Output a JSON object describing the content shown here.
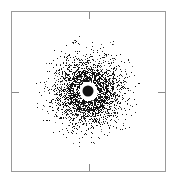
{
  "chart_data": {
    "type": "scatter",
    "title": "",
    "xlabel": "",
    "ylabel": "",
    "legend": [],
    "grid": false,
    "center": [
      88,
      91
    ],
    "core_radius": 5.5,
    "gap_outer_radius": 9.5,
    "dense_ring_peak_radius": 17,
    "cloud_sigma": 16,
    "cloud_extent_radius": 55,
    "point_count": 9000,
    "point_color": "#111111",
    "ticks": {
      "top": {
        "x": 88
      },
      "bottom": {
        "x": 88
      },
      "left": {
        "y": 91
      },
      "right": {
        "y": 91
      }
    },
    "frame": {
      "left": 11,
      "top": 11,
      "right": 166,
      "bottom": 172,
      "color": "#9a9a9a"
    }
  }
}
